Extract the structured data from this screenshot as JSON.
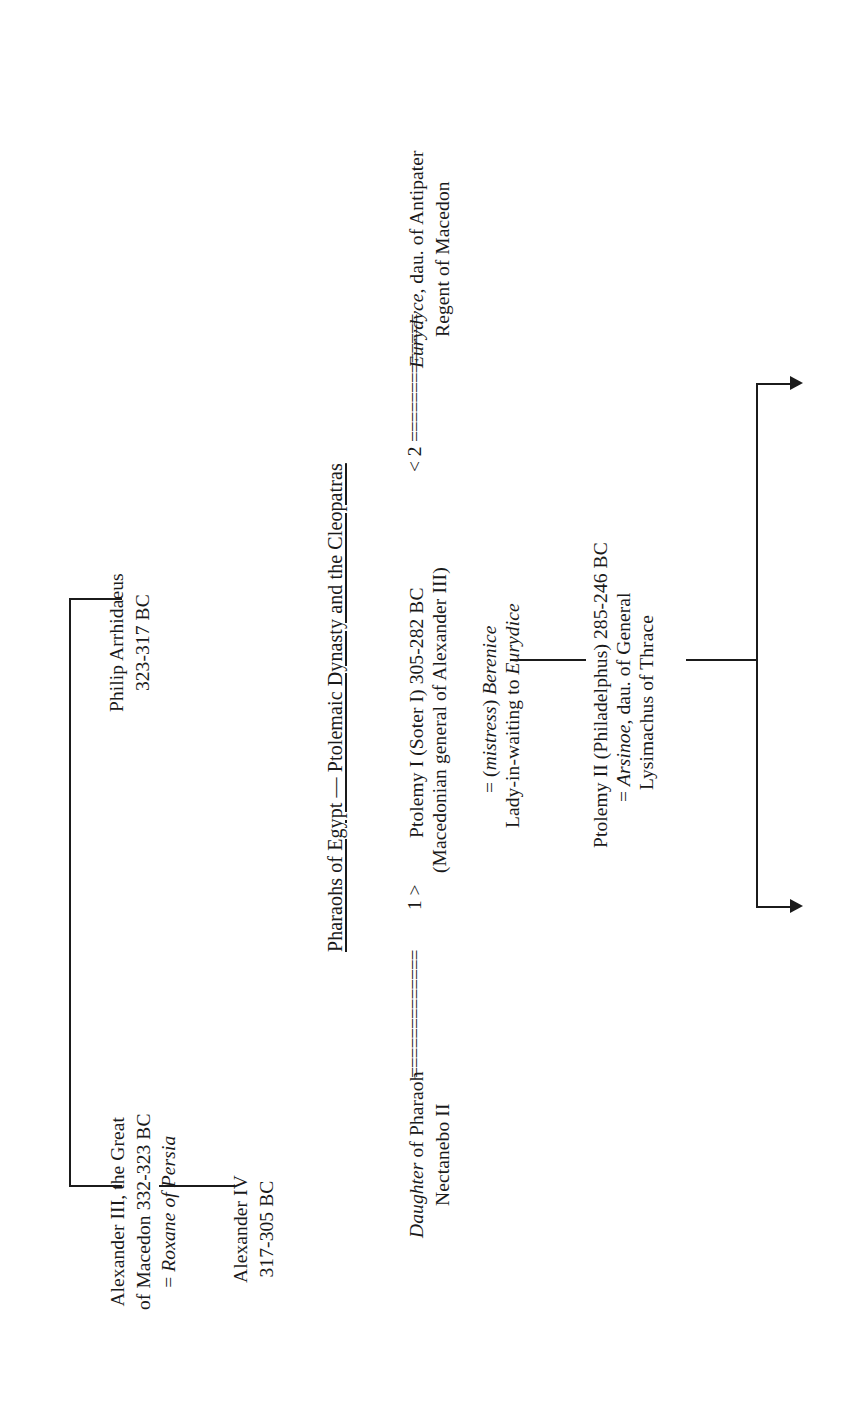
{
  "document": {
    "title": "Pharaohs of Egypt — Ptolemaic Dynasty and the Cleopatras",
    "orientation": "sideways (text rotated 90° counter-clockwise)"
  },
  "people": {
    "alexander_iii": {
      "line1": "Alexander III, the Great",
      "line2": "of Macedon 332-323 BC",
      "spouse_prefix": "= ",
      "spouse": "Roxane of Persia"
    },
    "philip_arrhidaeus": {
      "line1": "Philip Arrhidaeus",
      "line2": "323-317 BC"
    },
    "alexander_iv": {
      "line1": "Alexander IV",
      "line2": "317-305 BC"
    },
    "ptolemy_i": {
      "line1": "Ptolemy I (Soter I) 305-282 BC",
      "line2": "(Macedonian general of Alexander III)",
      "mistress_prefix": "= (",
      "mistress_label": "mistress",
      "mistress_close": ") ",
      "mistress_name": "Berenice",
      "mistress_role_prefix": "Lady-in-waiting to ",
      "mistress_role_name": "Eurydice"
    },
    "daughter_of_pharaoh": {
      "italic_word": "Daughter",
      "rest": " of Pharaoh",
      "line2": "Nectanebo II"
    },
    "eurydyce": {
      "italic_word": "Eurydyce",
      "rest": ", dau. of Antipater",
      "line2": "Regent of Macedon"
    },
    "ptolemy_ii": {
      "line1": "Ptolemy II (Philadelphus) 285-246 BC",
      "spouse_prefix": "= ",
      "spouse_name": "Arsinoe",
      "spouse_rest": ", dau. of General",
      "line2": "Lysimachus of Thrace"
    }
  },
  "markers": {
    "marriage_one": "1 >",
    "marriage_two": "< 2",
    "marriage_rule": "=============",
    "marriage_rule_short": "============="
  },
  "colors": {
    "ink": "#1a1a1a",
    "rule": "#1b1b1b",
    "page": "#ffffff"
  }
}
